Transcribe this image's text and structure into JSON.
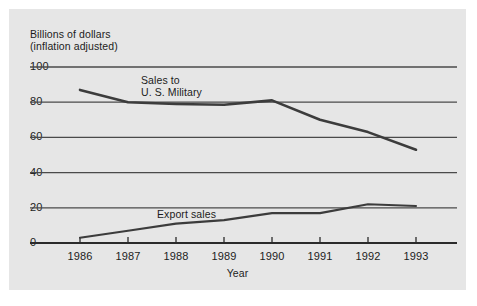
{
  "chart_data": {
    "type": "line",
    "title": "",
    "ylabel": "Billions of dollars\n(inflation adjusted)",
    "ylabel_line1": "Billions of dollars",
    "ylabel_line2": "(inflation adjusted)",
    "xlabel": "Year",
    "categories": [
      "1986",
      "1987",
      "1988",
      "1989",
      "1990",
      "1991",
      "1992",
      "1993"
    ],
    "x": [
      1986,
      1987,
      1988,
      1989,
      1990,
      1991,
      1992,
      1993
    ],
    "ylim": [
      0,
      100
    ],
    "xlim": [
      1985.6,
      1993.9
    ],
    "yticks": [
      0,
      20,
      40,
      60,
      80,
      100
    ],
    "ytick_labels": [
      "0",
      "20",
      "40",
      "60",
      "80",
      "100"
    ],
    "grid": "horizontal",
    "legend": "inline-annotations",
    "series": [
      {
        "name": "Sales to U. S. Military",
        "label_line1": "Sales to",
        "label_line2": "U. S. Military",
        "values": [
          87,
          80,
          79,
          78.5,
          81,
          70,
          63,
          53
        ],
        "color": "#3c3c3c"
      },
      {
        "name": "Export sales",
        "label_line1": "Export sales",
        "values": [
          3,
          7,
          11,
          13,
          17,
          17,
          22,
          21
        ],
        "color": "#3c3c3c"
      }
    ],
    "colors": {
      "background": "#e6e6e6",
      "page": "#ffffff",
      "gridline": "#4a4a4a",
      "axis": "#2b2b2b",
      "text": "#1c1c1c"
    }
  }
}
